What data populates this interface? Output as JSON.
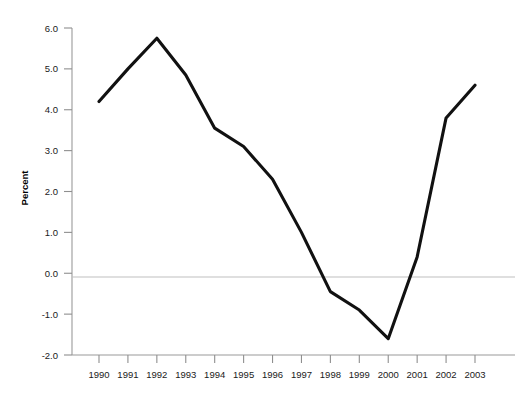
{
  "chart_data": {
    "type": "line",
    "title": "",
    "subtitle": "",
    "xlabel": "",
    "ylabel": "Percent",
    "categories": [
      "1990",
      "1991",
      "1992",
      "1993",
      "1994",
      "1995",
      "1996",
      "1997",
      "1998",
      "1999",
      "2000",
      "2001",
      "2002",
      "2003"
    ],
    "values": [
      4.2,
      5.0,
      5.75,
      4.85,
      3.55,
      3.1,
      2.3,
      1.0,
      -0.45,
      -0.9,
      -1.6,
      0.4,
      3.8,
      4.6
    ],
    "series": [
      {
        "name": "Percent",
        "values": [
          4.2,
          5.0,
          5.75,
          4.85,
          3.55,
          3.1,
          2.3,
          1.0,
          -0.45,
          -0.9,
          -1.6,
          0.4,
          3.8,
          4.6
        ]
      }
    ],
    "ylim": [
      -2.0,
      6.0
    ],
    "ytick_labels": [
      "6.0",
      "5.0",
      "4.0",
      "3.0",
      "2.0",
      "1.0",
      "0.0",
      "-1.0",
      "-2.0"
    ],
    "ytick_values": [
      6.0,
      5.0,
      4.0,
      3.0,
      2.0,
      1.0,
      0.0,
      -1.0,
      -2.0
    ],
    "xtick_labels": [
      "1990",
      "1991",
      "1992",
      "1993",
      "1994",
      "1995",
      "1996",
      "1997",
      "1998",
      "1999",
      "2000",
      "2001",
      "2002",
      "2003"
    ],
    "grid": false,
    "zero_line": true,
    "legend": "none",
    "legend_position": "none",
    "line_color": "#111111",
    "axis_color": "#9a9a9a",
    "zero_line_color": "#bfbfbf"
  }
}
